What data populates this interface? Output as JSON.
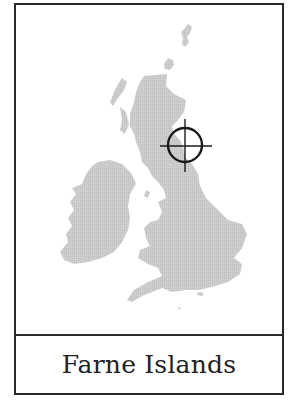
{
  "map": {
    "region": "British Isles",
    "land_color": "#c9c9c9",
    "border_color": "#2a2a2a",
    "marker": {
      "icon": "crosshair-target-icon",
      "cx": 183,
      "cy": 143,
      "radius": 17,
      "color": "#1a1a1a"
    }
  },
  "label": {
    "text": "Farne Islands"
  }
}
